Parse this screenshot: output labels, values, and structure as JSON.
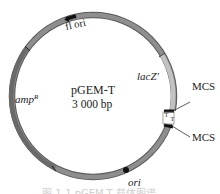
{
  "diagram": {
    "plasmid_name": "pGEM-T",
    "plasmid_size": "3 000 bp",
    "features": {
      "f1_ori": "fl ori",
      "lacZ": "lacZ'",
      "mcs_top": "MCS",
      "mcs_bottom": "MCS",
      "ampR_base": "amp",
      "ampR_sup": "R",
      "ori": "ori",
      "t_overhang_left": "T",
      "t_overhang_right": "T"
    },
    "caption": "图 1-1 pGEM-T 载体图谱"
  },
  "colors": {
    "backbone": "#8a8a8a",
    "backbone_edge": "#5a5a5a",
    "ampR": "#6e6e6e",
    "lacZ": "#bdbdbd",
    "marker": "#111111",
    "caption": "#c8c8c8"
  }
}
